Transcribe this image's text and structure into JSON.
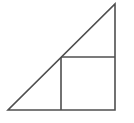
{
  "figure": {
    "background_color": "#ffffff",
    "stroke_color": "#4f4f4f",
    "stroke_width": 1.6,
    "canvas": {
      "width": 134,
      "height": 123
    }
  },
  "chart_data": {
    "type": "diagram",
    "xlabel": "",
    "ylabel": "",
    "shapes": [
      {
        "name": "right-triangle",
        "kind": "polygon",
        "closed": true,
        "vertices": [
          {
            "label": "A",
            "x": 8,
            "y": 110
          },
          {
            "label": "B",
            "x": 115,
            "y": 110
          },
          {
            "label": "C",
            "x": 115,
            "y": 4
          }
        ],
        "stroke": "#4f4f4f",
        "fill": "none"
      },
      {
        "name": "inscribed-square",
        "kind": "polygon",
        "closed": true,
        "vertices": [
          {
            "label": "P",
            "x": 61,
            "y": 57
          },
          {
            "label": "Q",
            "x": 115,
            "y": 57
          },
          {
            "label": "R",
            "x": 115,
            "y": 110
          },
          {
            "label": "S",
            "x": 61,
            "y": 110
          }
        ],
        "stroke": "#4f4f4f",
        "fill": "none"
      }
    ],
    "segments": [
      {
        "name": "triangle-base",
        "x1": 8,
        "y1": 110,
        "x2": 115,
        "y2": 110
      },
      {
        "name": "triangle-right-leg",
        "x1": 115,
        "y1": 110,
        "x2": 115,
        "y2": 4
      },
      {
        "name": "triangle-hypotenuse",
        "x1": 115,
        "y1": 4,
        "x2": 8,
        "y2": 110
      },
      {
        "name": "square-top-edge",
        "x1": 61,
        "y1": 57,
        "x2": 115,
        "y2": 57
      },
      {
        "name": "square-left-edge",
        "x1": 61,
        "y1": 57,
        "x2": 61,
        "y2": 110
      }
    ]
  }
}
